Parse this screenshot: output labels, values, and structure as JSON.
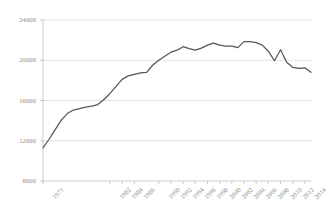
{
  "chart_data": {
    "type": "line",
    "title": "",
    "subtitle": "",
    "xlabel": "",
    "ylabel": "",
    "grid": true,
    "legend": false,
    "legend_position": "none",
    "line_color": "#555555",
    "grid_color": "#d9d9d9",
    "axis_color": "#bfbfbf",
    "tick_label_color": "#8a8a8a",
    "background_color": "#ffffff",
    "xlim": [
      1971,
      2015
    ],
    "ylim": [
      8000,
      24000
    ],
    "ytick_labels": [
      "24000",
      "20000",
      "16000",
      "12000",
      "8000"
    ],
    "ytick_values": [
      24000,
      20000,
      16000,
      12000,
      8000
    ],
    "xtick_labels": [
      "1971",
      "1982",
      "1984",
      "1986",
      "1990",
      "1992",
      "1994",
      "1996",
      "1998",
      "2000",
      "2002",
      "2004",
      "2006",
      "2008",
      "2010",
      "2012",
      "2014"
    ],
    "xtick_values": [
      1971,
      1982,
      1984,
      1986,
      1990,
      1992,
      1994,
      1996,
      1998,
      2000,
      2002,
      2004,
      2006,
      2008,
      2010,
      2012,
      2014
    ],
    "x": [
      1971,
      1973,
      1975,
      1977,
      1979,
      1981,
      1983,
      1985,
      1987,
      1989,
      1991,
      1993,
      1995,
      1997,
      1999,
      2001,
      2003,
      2005,
      2007,
      2009,
      2011,
      2013,
      2015
    ],
    "series": [
      {
        "name": "value",
        "values": [
          11300,
          12600,
          14000,
          14900,
          15300,
          15500,
          15600,
          16400,
          17200,
          18400,
          18800,
          18900,
          19700,
          20500,
          21000,
          21500,
          21200,
          21600,
          21700,
          21500,
          21400,
          21800,
          21800
        ]
      }
    ],
    "points": [
      {
        "x": 1971,
        "y": 11300
      },
      {
        "x": 1972,
        "y": 12150
      },
      {
        "x": 1973,
        "y": 13100
      },
      {
        "x": 1974,
        "y": 14050
      },
      {
        "x": 1975,
        "y": 14700
      },
      {
        "x": 1976,
        "y": 15050
      },
      {
        "x": 1977,
        "y": 15200
      },
      {
        "x": 1978,
        "y": 15350
      },
      {
        "x": 1979,
        "y": 15450
      },
      {
        "x": 1980,
        "y": 15600
      },
      {
        "x": 1981,
        "y": 16100
      },
      {
        "x": 1982,
        "y": 16700
      },
      {
        "x": 1983,
        "y": 17400
      },
      {
        "x": 1984,
        "y": 18100
      },
      {
        "x": 1985,
        "y": 18450
      },
      {
        "x": 1986,
        "y": 18600
      },
      {
        "x": 1987,
        "y": 18750
      },
      {
        "x": 1988,
        "y": 18800
      },
      {
        "x": 1989,
        "y": 19500
      },
      {
        "x": 1990,
        "y": 20000
      },
      {
        "x": 1991,
        "y": 20400
      },
      {
        "x": 1992,
        "y": 20800
      },
      {
        "x": 1993,
        "y": 21000
      },
      {
        "x": 1994,
        "y": 21350
      },
      {
        "x": 1995,
        "y": 21150
      },
      {
        "x": 1996,
        "y": 21000
      },
      {
        "x": 1997,
        "y": 21200
      },
      {
        "x": 1998,
        "y": 21500
      },
      {
        "x": 1999,
        "y": 21700
      },
      {
        "x": 2000,
        "y": 21500
      },
      {
        "x": 2001,
        "y": 21400
      },
      {
        "x": 2002,
        "y": 21400
      },
      {
        "x": 2003,
        "y": 21250
      },
      {
        "x": 2004,
        "y": 21850
      },
      {
        "x": 2005,
        "y": 21850
      },
      {
        "x": 2006,
        "y": 21750
      },
      {
        "x": 2007,
        "y": 21500
      },
      {
        "x": 2008,
        "y": 20900
      },
      {
        "x": 2009,
        "y": 19950
      },
      {
        "x": 2010,
        "y": 21050
      },
      {
        "x": 2011,
        "y": 19800
      },
      {
        "x": 2012,
        "y": 19300
      },
      {
        "x": 2013,
        "y": 19200
      },
      {
        "x": 2014,
        "y": 19250
      },
      {
        "x": 2015,
        "y": 18800
      }
    ],
    "annotations": []
  }
}
